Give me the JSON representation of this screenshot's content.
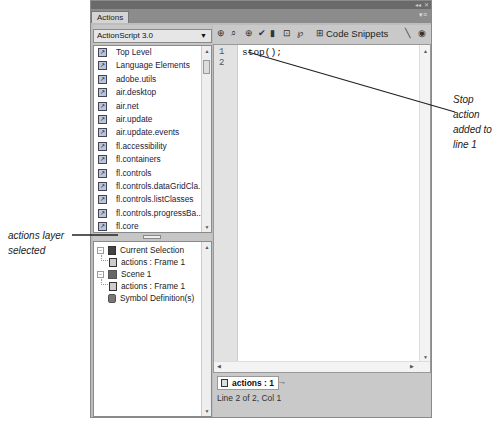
{
  "window": {
    "tab_label": "Actions",
    "collapse_icon": "collapse-icon",
    "close_icon": "close-icon",
    "panel_menu_icon": "panel-menu-icon"
  },
  "toolbox": {
    "language_select": "ActionScript 3.0",
    "items": [
      {
        "label": "Top Level"
      },
      {
        "label": "Language Elements"
      },
      {
        "label": "adobe.utils"
      },
      {
        "label": "air.desktop"
      },
      {
        "label": "air.net"
      },
      {
        "label": "air.update"
      },
      {
        "label": "air.update.events"
      },
      {
        "label": "fl.accessibility"
      },
      {
        "label": "fl.containers"
      },
      {
        "label": "fl.controls"
      },
      {
        "label": "fl.controls.dataGridCla..."
      },
      {
        "label": "fl.controls.listClasses"
      },
      {
        "label": "fl.controls.progressBa..."
      },
      {
        "label": "fl.core"
      },
      {
        "label": "fl.data"
      }
    ]
  },
  "navigator": {
    "items": [
      {
        "label": "Current Selection",
        "level": 0,
        "expander": "−"
      },
      {
        "label": "actions : Frame 1",
        "level": 1
      },
      {
        "label": "Scene 1",
        "level": 0,
        "expander": "−"
      },
      {
        "label": "actions : Frame 1",
        "level": 1
      },
      {
        "label": "Symbol Definition(s)",
        "level": 0
      }
    ]
  },
  "toolbar": {
    "icons": [
      "add-statement-icon",
      "find-icon",
      "insert-target-path-icon",
      "check-syntax-icon",
      "auto-format-icon",
      "show-code-hint-icon",
      "debug-options-icon"
    ],
    "code_snippets_label": "Code Snippets",
    "wand_icon": "script-assist-icon",
    "help_icon": "help-icon"
  },
  "editor": {
    "line_numbers": [
      "1",
      "2"
    ],
    "lines": [
      "stop();",
      ""
    ]
  },
  "script_tab": {
    "label": "actions : 1"
  },
  "status_bar": {
    "text": "Line 2 of 2, Col 1"
  },
  "annotations": {
    "right": "Stop action added to line 1",
    "right_lines": [
      "Stop action",
      "added to",
      "line 1"
    ],
    "left_lines": [
      "actions layer",
      "selected"
    ]
  }
}
